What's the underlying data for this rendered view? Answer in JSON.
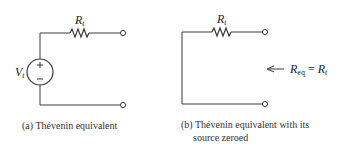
{
  "figure_a": {
    "resistor_label_main": "R",
    "resistor_label_sub": "t",
    "source_label_main": "V",
    "source_label_sub": "t",
    "source_plus": "+",
    "source_minus": "–",
    "caption": "(a) Thévenin equivalent"
  },
  "figure_b": {
    "resistor_label_main": "R",
    "resistor_label_sub": "t",
    "req_main": "R",
    "req_sub": "eq",
    "req_equals": " = ",
    "req_rhs_main": "R",
    "req_rhs_sub": "t",
    "caption_line1": "(b) Thévenin equivalent with its",
    "caption_line2": "source zeroed"
  },
  "colors": {
    "wire": "#3a3a3a",
    "background": "#ffffff"
  }
}
